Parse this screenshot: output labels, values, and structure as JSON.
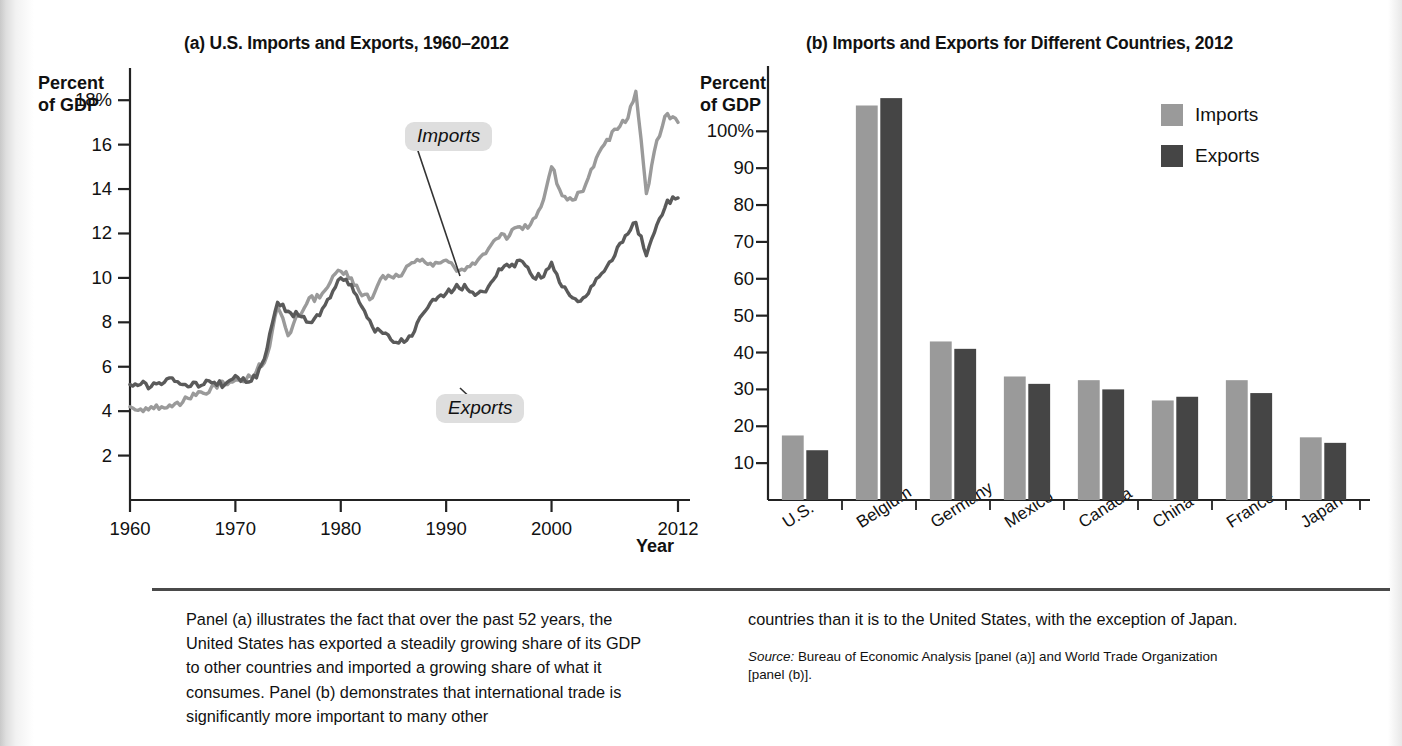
{
  "figure": {
    "panel_a": {
      "title": "(a) U.S. Imports and Exports, 1960–2012",
      "y_axis_caption_line1": "Percent",
      "y_axis_caption_line2": "of GDP",
      "x_axis_caption": "Year",
      "callout_imports": "Imports",
      "callout_exports": "Exports"
    },
    "panel_b": {
      "title": "(b) Imports and Exports for Different Countries, 2012",
      "y_axis_caption_line1": "Percent",
      "y_axis_caption_line2": "of GDP",
      "legend": [
        {
          "label": "Imports",
          "color": "#9a9a9a"
        },
        {
          "label": "Exports",
          "color": "#454545"
        }
      ]
    }
  },
  "caption": {
    "left_paragraph": "Panel (a) illustrates the fact that over the past 52 years, the United States has exported a steadily growing share of its GDP to other countries and imported a growing share of what it consumes. Panel (b) demonstrates that international trade is significantly more important to many other",
    "right_paragraph": "countries than it is to the United States, with the exception of Japan.",
    "source_label": "Source:",
    "source_text": " Bureau of Economic Analysis [panel (a)] and World Trade Organization [panel (b)]."
  },
  "chart_data": [
    {
      "type": "line",
      "panel": "a",
      "title": "(a) U.S. Imports and Exports, 1960–2012",
      "xlabel": "Year",
      "ylabel": "Percent of GDP",
      "xlim": [
        1960,
        2012
      ],
      "ylim": [
        0,
        19
      ],
      "grid": false,
      "legend_position": "inline-callouts",
      "xticks": [
        1960,
        1970,
        1980,
        1990,
        2000,
        2012
      ],
      "xtick_labels": [
        "1960",
        "1970",
        "1980",
        "1990",
        "2000",
        "2012"
      ],
      "yticks": [
        2,
        4,
        6,
        8,
        10,
        12,
        14,
        16,
        18
      ],
      "ytick_labels": [
        "2",
        "4",
        "6",
        "8",
        "10",
        "12",
        "14",
        "16",
        "18%"
      ],
      "x": [
        1960,
        1961,
        1962,
        1963,
        1964,
        1965,
        1966,
        1967,
        1968,
        1969,
        1970,
        1971,
        1972,
        1973,
        1974,
        1975,
        1976,
        1977,
        1978,
        1979,
        1980,
        1981,
        1982,
        1983,
        1984,
        1985,
        1986,
        1987,
        1988,
        1989,
        1990,
        1991,
        1992,
        1993,
        1994,
        1995,
        1996,
        1997,
        1998,
        1999,
        2000,
        2001,
        2002,
        2003,
        2004,
        2005,
        2006,
        2007,
        2008,
        2009,
        2010,
        2011,
        2012
      ],
      "series": [
        {
          "name": "Imports",
          "color": "#9a9a9a",
          "values": [
            4.2,
            4.1,
            4.2,
            4.2,
            4.2,
            4.4,
            4.8,
            4.8,
            5.2,
            5.2,
            5.4,
            5.4,
            5.8,
            6.5,
            8.7,
            7.4,
            8.3,
            9.1,
            9.1,
            9.8,
            10.3,
            10.0,
            9.2,
            9.1,
            10.1,
            10.0,
            10.3,
            10.7,
            10.7,
            10.7,
            10.8,
            10.3,
            10.5,
            10.8,
            11.3,
            11.8,
            11.9,
            12.3,
            12.4,
            13.2,
            15.0,
            13.7,
            13.5,
            13.9,
            15.0,
            16.0,
            16.7,
            17.0,
            18.4,
            13.8,
            16.2,
            17.4,
            17.0
          ]
        },
        {
          "name": "Exports",
          "color": "#5a5a5a",
          "values": [
            5.2,
            5.2,
            5.1,
            5.2,
            5.5,
            5.2,
            5.3,
            5.2,
            5.3,
            5.2,
            5.6,
            5.3,
            5.5,
            6.8,
            8.9,
            8.5,
            8.3,
            8.0,
            8.3,
            9.1,
            10.0,
            9.7,
            8.7,
            7.8,
            7.5,
            7.1,
            7.1,
            7.6,
            8.5,
            9.0,
            9.3,
            9.7,
            9.5,
            9.3,
            9.6,
            10.4,
            10.5,
            10.8,
            10.2,
            10.0,
            10.7,
            9.6,
            9.1,
            9.1,
            9.7,
            10.3,
            11.0,
            11.9,
            12.5,
            11.0,
            12.4,
            13.5,
            13.6
          ]
        }
      ]
    },
    {
      "type": "bar",
      "panel": "b",
      "title": "(b) Imports and Exports for Different Countries, 2012",
      "xlabel": "",
      "ylabel": "Percent of GDP",
      "ylim": [
        0,
        115
      ],
      "grid": false,
      "legend_position": "top-right",
      "yticks": [
        10,
        20,
        30,
        40,
        50,
        60,
        70,
        80,
        90,
        100
      ],
      "ytick_labels": [
        "10",
        "20",
        "30",
        "40",
        "50",
        "60",
        "70",
        "80",
        "90",
        "100%"
      ],
      "categories": [
        "U.S.",
        "Belgium",
        "Germany",
        "Mexico",
        "Canada",
        "China",
        "France",
        "Japan"
      ],
      "series": [
        {
          "name": "Imports",
          "color": "#9a9a9a",
          "values": [
            17.5,
            107,
            43,
            33.5,
            32.5,
            27,
            32.5,
            17
          ]
        },
        {
          "name": "Exports",
          "color": "#454545",
          "values": [
            13.5,
            109,
            41,
            31.5,
            30,
            28,
            29,
            15.5
          ]
        }
      ]
    }
  ]
}
